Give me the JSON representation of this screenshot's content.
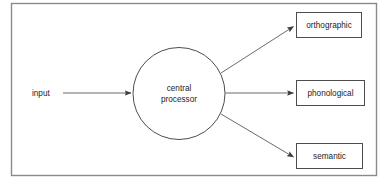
{
  "figure": {
    "type": "flow-diagram",
    "frame": {
      "stroke": "#8a8a8a",
      "fill": "#ffffff"
    },
    "line_color": "#6b6b6b",
    "text_color": "#1c1c1c"
  },
  "input": {
    "label": "input"
  },
  "processor": {
    "label_line1": "central",
    "label_line2": "processor",
    "shape": "circle"
  },
  "outputs": [
    {
      "label": "orthographic"
    },
    {
      "label": "phonological"
    },
    {
      "label": "semantic"
    }
  ],
  "arrows": [
    {
      "name": "input-to-processor"
    },
    {
      "name": "processor-to-orthographic"
    },
    {
      "name": "processor-to-phonological"
    },
    {
      "name": "processor-to-semantic"
    }
  ]
}
